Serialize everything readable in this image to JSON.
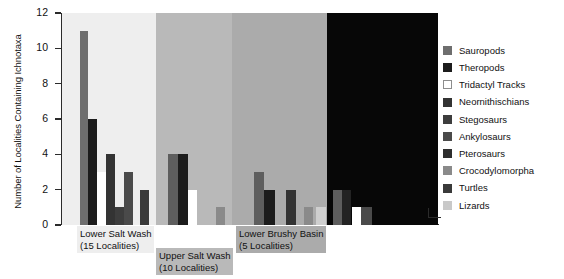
{
  "chart_data": {
    "type": "bar",
    "title": "",
    "xlabel": "",
    "ylabel": "Number of Localities Containing Ichnotaxa",
    "ylim": [
      0,
      12
    ],
    "yticks": [
      0,
      2,
      4,
      6,
      8,
      10,
      12
    ],
    "grid": false,
    "legend_position": "right",
    "legend": [
      {
        "name": "Sauropods",
        "color": "#6e6e6e"
      },
      {
        "name": "Theropods",
        "color": "#1c1c1c"
      },
      {
        "name": "Tridactyl Tracks",
        "color": "#ffffff"
      },
      {
        "name": "Neornithischians",
        "color": "#333333"
      },
      {
        "name": "Stegosaurs",
        "color": "#3d3d3d"
      },
      {
        "name": "Ankylosaurs",
        "color": "#4a4a4a"
      },
      {
        "name": "Pterosaurs",
        "color": "#2e2e2e"
      },
      {
        "name": "Crocodylomorpha",
        "color": "#8a8a8a"
      },
      {
        "name": "Turtles",
        "color": "#3a3a3a"
      },
      {
        "name": "Lizards",
        "color": "#c9c9c9"
      }
    ],
    "groups": [
      {
        "label": "Lower Salt Wash",
        "sublabel": "(15 Localities)",
        "localities": 15,
        "background": "#eeeeee",
        "caption_background": "#eeeeee",
        "values": [
          {
            "taxon": "Sauropods",
            "value": 11,
            "color": "#6e6e6e"
          },
          {
            "taxon": "Theropods",
            "value": 6,
            "color": "#1c1c1c"
          },
          {
            "taxon": "Tridactyl Tracks",
            "value": 3,
            "color": "#ffffff"
          },
          {
            "taxon": "Neornithischians",
            "value": 4,
            "color": "#333333"
          },
          {
            "taxon": "Stegosaurs",
            "value": 1,
            "color": "#3d3d3d"
          },
          {
            "taxon": "Ankylosaurs",
            "value": 3,
            "color": "#4a4a4a"
          },
          {
            "taxon": "Turtles",
            "value": 2,
            "color": "#3a3a3a"
          }
        ]
      },
      {
        "label": "Upper Salt Wash",
        "sublabel": "(10 Localities)",
        "localities": 10,
        "background": "#b9b9b9",
        "caption_background": "#b9b9b9",
        "values": [
          {
            "taxon": "Sauropods",
            "value": 4,
            "color": "#5e5e5e"
          },
          {
            "taxon": "Theropods",
            "value": 4,
            "color": "#1c1c1c"
          },
          {
            "taxon": "Tridactyl Tracks",
            "value": 2,
            "color": "#ffffff"
          },
          {
            "taxon": "Crocodylomorpha",
            "value": 1,
            "color": "#8a8a8a"
          }
        ]
      },
      {
        "label": "Lower Brushy Basin",
        "sublabel": "(5 Localities)",
        "localities": 5,
        "background": "#ababab",
        "caption_background": "#ababab",
        "values": [
          {
            "taxon": "Sauropods",
            "value": 3,
            "color": "#5e5e5e"
          },
          {
            "taxon": "Theropods",
            "value": 2,
            "color": "#1c1c1c"
          },
          {
            "taxon": "Neornithischians",
            "value": 2,
            "color": "#333333"
          },
          {
            "taxon": "Crocodylomorpha",
            "value": 1,
            "color": "#8a8a8a"
          },
          {
            "taxon": "Lizards",
            "value": 1,
            "color": "#cfcfcf"
          }
        ]
      },
      {
        "label": "",
        "sublabel": "",
        "localities": 0,
        "background": "#070707",
        "caption_background": "#070707",
        "values": [
          {
            "taxon": "Sauropods",
            "value": 2,
            "color": "#5e5e5e"
          },
          {
            "taxon": "Theropods",
            "value": 2,
            "color": "#232323"
          },
          {
            "taxon": "Tridactyl Tracks",
            "value": 1,
            "color": "#ffffff"
          },
          {
            "taxon": "Pterosaurs",
            "value": 1,
            "color": "#4a4a4a"
          }
        ]
      }
    ]
  },
  "layout": {
    "bands": [
      {
        "x": 62,
        "w": 94,
        "color": "#eeeeee"
      },
      {
        "x": 156,
        "w": 76,
        "color": "#b9b9b9"
      },
      {
        "x": 232,
        "w": 95,
        "color": "#ababab"
      },
      {
        "x": 327,
        "w": 111,
        "color": "#070707"
      }
    ],
    "bars": [
      {
        "x": 80,
        "w": 8,
        "v": 11,
        "color": "#6e6e6e"
      },
      {
        "x": 88,
        "w": 9,
        "v": 6,
        "color": "#1c1c1c"
      },
      {
        "x": 97,
        "w": 9,
        "v": 3,
        "color": "#ffffff"
      },
      {
        "x": 106,
        "w": 9,
        "v": 4,
        "color": "#333333"
      },
      {
        "x": 115,
        "w": 9,
        "v": 1,
        "color": "#3d3d3d"
      },
      {
        "x": 124,
        "w": 9,
        "v": 3,
        "color": "#4a4a4a"
      },
      {
        "x": 140,
        "w": 9,
        "v": 2,
        "color": "#3a3a3a"
      },
      {
        "x": 168,
        "w": 10,
        "v": 4,
        "color": "#5e5e5e"
      },
      {
        "x": 178,
        "w": 10,
        "v": 4,
        "color": "#1c1c1c"
      },
      {
        "x": 188,
        "w": 9,
        "v": 2,
        "color": "#ffffff"
      },
      {
        "x": 216,
        "w": 9,
        "v": 1,
        "color": "#8a8a8a"
      },
      {
        "x": 254,
        "w": 10,
        "v": 3,
        "color": "#5e5e5e"
      },
      {
        "x": 264,
        "w": 11,
        "v": 2,
        "color": "#1c1c1c"
      },
      {
        "x": 286,
        "w": 10,
        "v": 2,
        "color": "#333333"
      },
      {
        "x": 304,
        "w": 9,
        "v": 1,
        "color": "#8a8a8a"
      },
      {
        "x": 316,
        "w": 10,
        "v": 1,
        "color": "#cfcfcf"
      },
      {
        "x": 333,
        "w": 9,
        "v": 2,
        "color": "#5e5e5e"
      },
      {
        "x": 342,
        "w": 9,
        "v": 2,
        "color": "#232323"
      },
      {
        "x": 352,
        "w": 9,
        "v": 1,
        "color": "#ffffff"
      },
      {
        "x": 361,
        "w": 11,
        "v": 1,
        "color": "#4a4a4a"
      }
    ],
    "captions": [
      {
        "x": 77,
        "y": 226,
        "gi": 0
      },
      {
        "x": 156,
        "y": 248,
        "gi": 1
      },
      {
        "x": 236,
        "y": 226,
        "gi": 2
      }
    ]
  }
}
